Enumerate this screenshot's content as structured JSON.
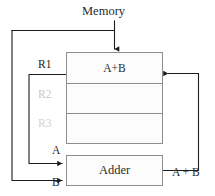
{
  "diagram": {
    "title_label": "Memory",
    "register_file": {
      "rows": [
        {
          "name_label": "R1",
          "content": "A+B",
          "active": true
        },
        {
          "name_label": "R2",
          "content": "",
          "active": false
        },
        {
          "name_label": "R3",
          "content": "",
          "active": false
        }
      ]
    },
    "adder": {
      "label": "Adder",
      "input_a_label": "A",
      "input_b_label": "B",
      "output_label": "A + B"
    },
    "colors": {
      "line": "#1c1c1c",
      "box_border": "#8e8e8e",
      "box_fill": "#fcfcfc",
      "text": "#2b2b2b",
      "inactive_text": "#cccccc",
      "background": "#ffffff"
    }
  }
}
